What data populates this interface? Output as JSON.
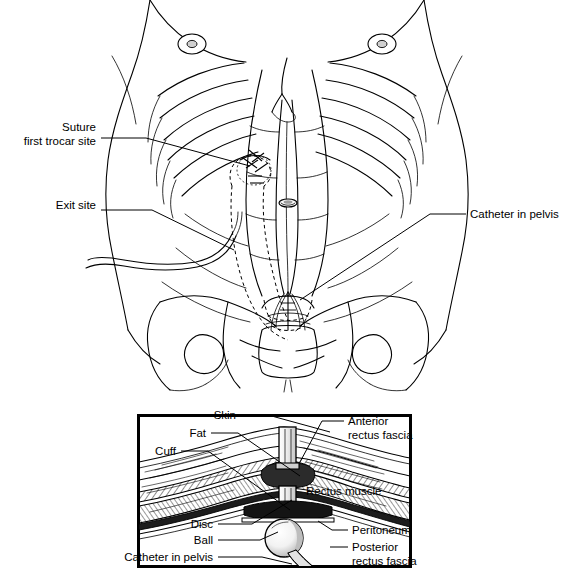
{
  "figure": {
    "panels": [
      "anterior-torso-view",
      "cross-section-inset"
    ]
  },
  "torso_labels": [
    {
      "id": "suture-first-trocar-site",
      "line1": "Suture",
      "line2": "first trocar site",
      "align": "right",
      "x": 96,
      "y": 131
    },
    {
      "id": "exit-site",
      "line1": "Exit site",
      "line2": "",
      "align": "right",
      "x": 96,
      "y": 209
    },
    {
      "id": "catheter-in-pelvis",
      "line1": "Catheter in pelvis",
      "line2": "",
      "align": "left",
      "x": 470,
      "y": 218
    }
  ],
  "inset_labels": [
    {
      "id": "skin",
      "line1": "Skin",
      "line2": "",
      "align": "right",
      "x": 236,
      "y": 419
    },
    {
      "id": "fat",
      "line1": "Fat",
      "line2": "",
      "align": "right",
      "x": 206,
      "y": 437
    },
    {
      "id": "cuff",
      "line1": "Cuff",
      "line2": "",
      "align": "right",
      "x": 176,
      "y": 455
    },
    {
      "id": "anterior-rectus-fascia",
      "line1": "Anterior",
      "line2": "rectus fascia",
      "align": "left",
      "x": 348,
      "y": 425
    },
    {
      "id": "rectus-muscle",
      "line1": "Rectus muscle",
      "line2": "",
      "align": "left",
      "x": 306,
      "y": 495
    },
    {
      "id": "disc",
      "line1": "Disc",
      "line2": "",
      "align": "right",
      "x": 213,
      "y": 528
    },
    {
      "id": "ball",
      "line1": "Ball",
      "line2": "",
      "align": "right",
      "x": 213,
      "y": 544
    },
    {
      "id": "catheter-in-pelvis-inset",
      "line1": "Catheter in pelvis",
      "line2": "",
      "align": "right",
      "x": 213,
      "y": 561
    },
    {
      "id": "peritoneum",
      "line1": "Peritoneum",
      "line2": "",
      "align": "left",
      "x": 352,
      "y": 534
    },
    {
      "id": "posterior-rectus-fascia",
      "line1": "Posterior",
      "line2": "rectus fascia",
      "align": "left",
      "x": 352,
      "y": 551
    }
  ],
  "colors": {
    "ink": "#000000",
    "paper": "#ffffff",
    "hatch": "#888888",
    "shadow": "#b9b9b9",
    "device": "#d8d8d8"
  },
  "inset_box": {
    "x": 137,
    "y": 414,
    "width": 275,
    "height": 154
  }
}
